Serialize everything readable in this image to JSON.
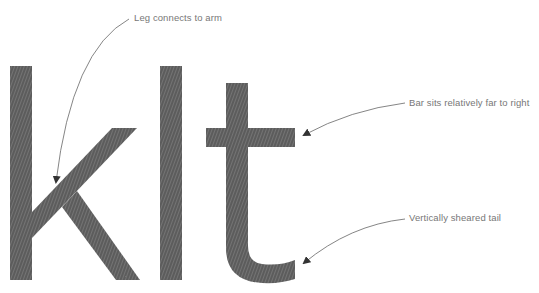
{
  "diagram": {
    "glyphs": "klt",
    "colors": {
      "glyph_fill": "#5a5a5a",
      "glyph_hatch": "#8a8a8a",
      "annotation_text": "#777777",
      "arrow": "#666666",
      "background": "#ffffff"
    },
    "annotations": [
      {
        "id": "leg",
        "text": "Leg connects to arm",
        "target": "k"
      },
      {
        "id": "bar",
        "text": "Bar sits relatively far to right",
        "target": "t crossbar"
      },
      {
        "id": "tail",
        "text": "Vertically sheared tail",
        "target": "t tail"
      }
    ]
  }
}
